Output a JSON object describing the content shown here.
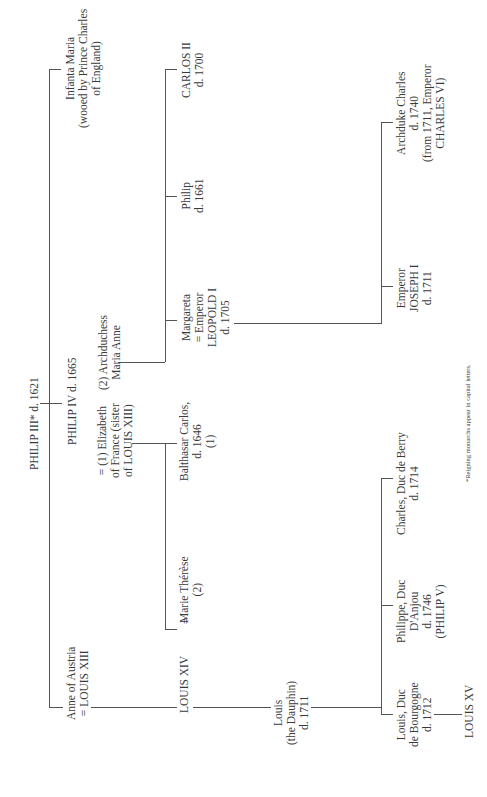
{
  "diagram": {
    "type": "family-tree",
    "orientation": "rotated-90-ccw",
    "footnote": "*Reigning monarchs appear in capital letters.",
    "nodes": {
      "philip3": [
        "PHILIP III* d. 1621"
      ],
      "philip4": [
        "PHILIP IV d. 1665"
      ],
      "elizabeth": [
        "= (1) Elizabeth",
        "of France (sister",
        "of LOUIS XIII)"
      ],
      "maria_anne": [
        "(2) Archduchess",
        "Maria Anne"
      ],
      "infanta_maria": [
        "Infanta Maria",
        "(wooed by Prince Charles",
        "of England)"
      ],
      "anne": [
        "Anne of Austria",
        "= LOUIS XIII"
      ],
      "louis14": [
        "LOUIS XIV"
      ],
      "marriage_eq": [
        "="
      ],
      "marie_therese": [
        "Marie Thérèse",
        "(2)"
      ],
      "balthasar": [
        "Balthasar Carlos,",
        "d. 1646",
        "(1)"
      ],
      "margareta": [
        "Margareta",
        "= Emperor",
        "LEOPOLD I",
        "d. 1705"
      ],
      "philip_1661": [
        "Philip",
        "d. 1661"
      ],
      "carlos2": [
        "CARLOS II",
        "d. 1700"
      ],
      "dauphin": [
        "Louis",
        "(the Dauphin)",
        "d. 1711"
      ],
      "bourgogne": [
        "Louis, Duc",
        "de Bourgogne",
        "d. 1712"
      ],
      "anjou": [
        "Philippe, Duc",
        "D'Anjou",
        "d. 1746",
        "(PHILIP V)"
      ],
      "berry": [
        "Charles, Duc de Berry",
        "d. 1714"
      ],
      "louis15": [
        "LOUIS XV"
      ],
      "joseph1": [
        "Emperor",
        "JOSEPH I",
        "d. 1711"
      ],
      "archduke_charles": [
        "Archduke Charles",
        "d. 1740",
        "(from 1711, Emperor",
        "CHARLES VI)"
      ]
    }
  }
}
